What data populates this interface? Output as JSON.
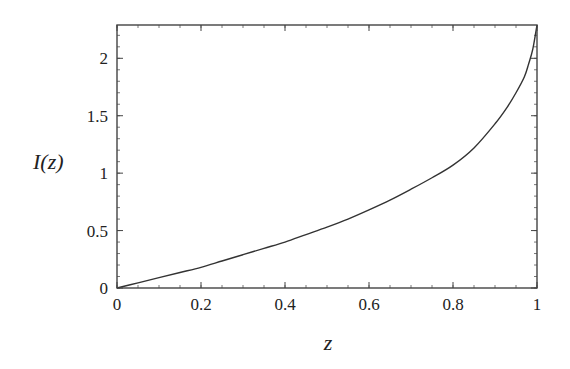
{
  "chart_data": {
    "type": "line",
    "title": "",
    "xlabel": "z",
    "ylabel": "I(z)",
    "xlim": [
      0,
      1
    ],
    "ylim": [
      0,
      2.29
    ],
    "grid": false,
    "legend": null,
    "x_ticks": [
      {
        "value": 0,
        "label": "0"
      },
      {
        "value": 0.2,
        "label": "0.2"
      },
      {
        "value": 0.4,
        "label": "0.4"
      },
      {
        "value": 0.6,
        "label": "0.6"
      },
      {
        "value": 0.8,
        "label": "0.8"
      },
      {
        "value": 1,
        "label": "1"
      }
    ],
    "y_ticks": [
      {
        "value": 0,
        "label": "0"
      },
      {
        "value": 0.5,
        "label": "0.5"
      },
      {
        "value": 1,
        "label": "1"
      },
      {
        "value": 1.5,
        "label": "1.5"
      },
      {
        "value": 2,
        "label": "2"
      }
    ],
    "x_minor_step": 0.05,
    "y_minor_step": 0.1,
    "series": [
      {
        "name": "I(z)",
        "color": "#333333",
        "x": [
          0,
          0.05,
          0.1,
          0.15,
          0.2,
          0.25,
          0.3,
          0.35,
          0.4,
          0.45,
          0.5,
          0.55,
          0.6,
          0.65,
          0.7,
          0.75,
          0.8,
          0.85,
          0.9,
          0.93,
          0.95,
          0.97,
          0.98,
          0.99,
          1.0
        ],
        "values": [
          0,
          0.045,
          0.09,
          0.135,
          0.18,
          0.235,
          0.29,
          0.345,
          0.4,
          0.465,
          0.53,
          0.6,
          0.68,
          0.765,
          0.86,
          0.96,
          1.07,
          1.22,
          1.43,
          1.58,
          1.7,
          1.84,
          1.95,
          2.08,
          2.29
        ]
      }
    ]
  }
}
